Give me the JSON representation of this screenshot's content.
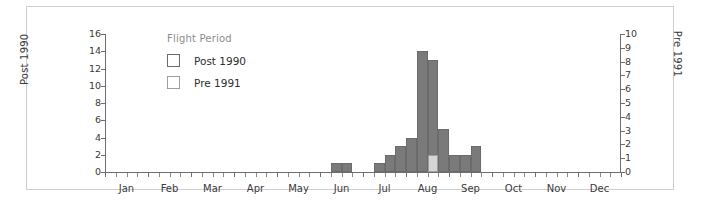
{
  "legend": {
    "title": "Flight Period",
    "position": "inside-upper-left",
    "entries": [
      {
        "label": "Post 1990",
        "color": "#7a7a7a"
      },
      {
        "label": "Pre 1991",
        "color": "#d5d5d5"
      }
    ]
  },
  "axes": {
    "left": {
      "title": "Post 1990",
      "min": 0,
      "max": 16,
      "step": 2,
      "ticks": [
        "0",
        "2",
        "4",
        "6",
        "8",
        "10",
        "12",
        "14",
        "16"
      ]
    },
    "right": {
      "title": "Pre 1991",
      "min": 0,
      "max": 10,
      "step": 1,
      "ticks": [
        "0",
        "1",
        "2",
        "3",
        "4",
        "5",
        "6",
        "7",
        "8",
        "9",
        "10"
      ]
    },
    "x": {
      "labels": [
        "Jan",
        "Feb",
        "Mar",
        "Apr",
        "May",
        "Jun",
        "Jul",
        "Aug",
        "Sep",
        "Oct",
        "Nov",
        "Dec"
      ],
      "minor_ticks_per_month": 4
    }
  },
  "chart_data": {
    "type": "bar",
    "title": "",
    "xlabel": "",
    "ylabel": "Post 1990",
    "ylabel_secondary": "Pre 1991",
    "ylim": [
      0,
      16
    ],
    "ylim_secondary": [
      0,
      10
    ],
    "grid": false,
    "legend_title": "Flight Period",
    "legend_position": "inside-upper-left",
    "categories": [
      "Jan",
      "Feb",
      "Mar",
      "Apr",
      "May",
      "Jun",
      "Jul",
      "Aug",
      "Sep",
      "Oct",
      "Nov",
      "Dec"
    ],
    "x_bins": [
      "Jun-b3",
      "Jun-b4",
      "Jul-b1",
      "Jul-b2",
      "Jul-b3",
      "Jul-b4",
      "Aug-b1",
      "Aug-b2",
      "Aug-b3",
      "Aug-b4",
      "Sep-b1",
      "Sep-b2"
    ],
    "series": [
      {
        "name": "Post 1990",
        "axis": "left",
        "color": "#7a7a7a",
        "values": [
          1,
          1,
          1,
          2,
          3,
          4,
          14,
          13,
          5,
          2,
          2,
          3
        ]
      },
      {
        "name": "Pre 1991",
        "axis": "right",
        "color": "#d5d5d5",
        "values": [
          0,
          0,
          0,
          0,
          0,
          0,
          0,
          1.25,
          0,
          0,
          0,
          0
        ],
        "values_left_scale": [
          0,
          0,
          0,
          0,
          0,
          0,
          0,
          2,
          0,
          0,
          0,
          0
        ]
      }
    ],
    "bars": [
      {
        "bin": 21,
        "series": "Post 1990",
        "value": 1
      },
      {
        "bin": 22,
        "series": "Post 1990",
        "value": 1
      },
      {
        "bin": 25,
        "series": "Post 1990",
        "value": 1
      },
      {
        "bin": 26,
        "series": "Post 1990",
        "value": 2
      },
      {
        "bin": 27,
        "series": "Post 1990",
        "value": 3
      },
      {
        "bin": 28,
        "series": "Post 1990",
        "value": 4
      },
      {
        "bin": 29,
        "series": "Post 1990",
        "value": 14
      },
      {
        "bin": 30,
        "series": "Post 1990",
        "value": 13
      },
      {
        "bin": 30,
        "series": "Pre 1991",
        "value": 2
      },
      {
        "bin": 31,
        "series": "Post 1990",
        "value": 5
      },
      {
        "bin": 32,
        "series": "Post 1990",
        "value": 2
      },
      {
        "bin": 33,
        "series": "Post 1990",
        "value": 2
      },
      {
        "bin": 34,
        "series": "Post 1990",
        "value": 3
      }
    ]
  },
  "style": {
    "background": "#ffffff",
    "frame_border": "#cfcfcf",
    "axis_color": "#6e6e6e",
    "text_color": "#3a3a3a",
    "legend_title_color": "#8c8c8c"
  }
}
